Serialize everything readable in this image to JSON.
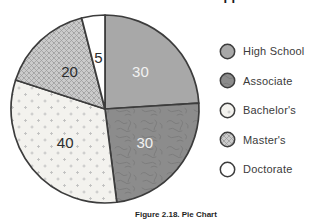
{
  "figure": {
    "caption": "Figure 2.18. Pie Chart"
  },
  "chart_data": {
    "type": "pie",
    "title": "Education Level of Applicants",
    "caption": "Figure 2.18. Pie Chart",
    "categories": [
      "High School",
      "Associate",
      "Bachelor's",
      "Master's",
      "Doctorate"
    ],
    "values": [
      30,
      30,
      40,
      20,
      5
    ],
    "total": 125,
    "start_angle_deg": 0,
    "direction": "clockwise",
    "legend_position": "right",
    "outline_color": "#3c3c3c",
    "slices": [
      {
        "label": "High School",
        "value": 30,
        "fill": "#a8a8a8",
        "pattern": "solid",
        "value_label_color": "#f1f1f1"
      },
      {
        "label": "Associate",
        "value": 30,
        "fill": "#8c8c8c",
        "pattern": "mottled",
        "value_label_color": "#f1f1f1"
      },
      {
        "label": "Bachelor's",
        "value": 40,
        "fill": "#f3f2ee",
        "pattern": "dots",
        "value_label_color": "#2d2d2d"
      },
      {
        "label": "Master's",
        "value": 20,
        "fill": "#cbcbcb",
        "pattern": "crosshatch",
        "value_label_color": "#2d2d2d"
      },
      {
        "label": "Doctorate",
        "value": 5,
        "fill": "#ffffff",
        "pattern": "solid",
        "value_label_color": "#2d2d2d"
      }
    ],
    "pattern_ink": {
      "dots": "#c0c0c0",
      "crosshatch": "#9b9b9b",
      "mottled": "#797979"
    }
  }
}
